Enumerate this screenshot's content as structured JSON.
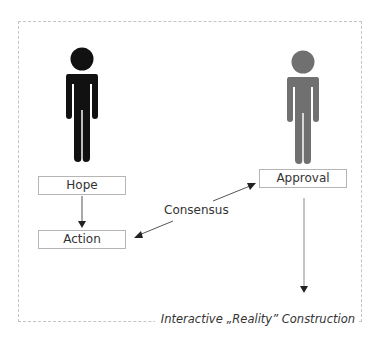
{
  "diagram": {
    "caption": "Interactive „Reality” Construction",
    "nodes": {
      "hope": "Hope",
      "action": "Action",
      "approval": "Approval"
    },
    "edge_labels": {
      "consensus": "Consensus"
    },
    "figures": [
      {
        "name": "left-person",
        "color": "#111111"
      },
      {
        "name": "right-person",
        "color": "#707070"
      }
    ],
    "edges": [
      {
        "from": "Hope",
        "to": "Action",
        "style": "arrow"
      },
      {
        "from": "Approval",
        "to": "Action",
        "label": "Consensus",
        "style": "bidirectional-arrow"
      },
      {
        "from": "Approval",
        "to": "Interactive Reality Construction",
        "style": "arrow"
      }
    ],
    "colors": {
      "dark_figure": "#111111",
      "gray_figure": "#707070",
      "box_border": "#b5b5b5",
      "frame_border": "#c4c4c4",
      "arrow_dark": "#222222",
      "arrow_gray": "#8a8a8a"
    }
  }
}
